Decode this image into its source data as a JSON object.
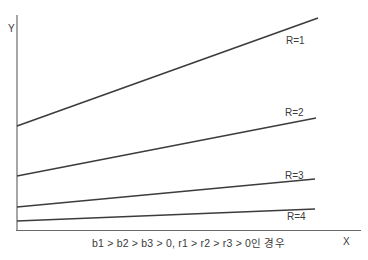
{
  "diagram": {
    "axes": {
      "y_label": "Y",
      "x_label": "X"
    },
    "lines": [
      {
        "label": "R=1",
        "start": [
          17,
          126
        ],
        "end": [
          318,
          18
        ]
      },
      {
        "label": "R=2",
        "start": [
          17,
          176
        ],
        "end": [
          316,
          118
        ]
      },
      {
        "label": "R=3",
        "start": [
          17,
          207
        ],
        "end": [
          315,
          179
        ]
      },
      {
        "label": "R=4",
        "start": [
          17,
          221
        ],
        "end": [
          315,
          209
        ]
      }
    ],
    "caption": "b1 > b2 > b3 > 0, r1 > r2 > r3 > 0인 경우",
    "colors": {
      "line": "#3c3c3c",
      "axis": "#6a6a6a",
      "text": "#3a3a3a",
      "background": "#ffffff"
    }
  }
}
